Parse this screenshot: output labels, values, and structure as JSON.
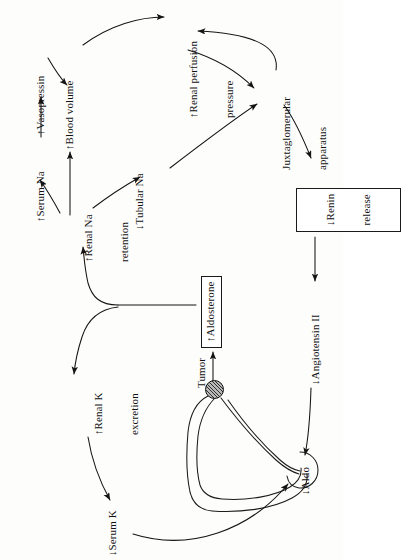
{
  "figure": {
    "orientation": "rotated-90-ccw",
    "type": "medical-flowchart"
  },
  "nodes": {
    "vasopressin": {
      "label": "↑Vasopressin",
      "boxed": false
    },
    "serum_na": {
      "label": "↑Serum Na",
      "boxed": false
    },
    "blood_volume": {
      "label": "↑Blood volume",
      "boxed": false
    },
    "renal_na_retention": {
      "line1": "↑Renal Na",
      "line2": "retention",
      "boxed": false
    },
    "tubular_na": {
      "label": "↓Tubular Na",
      "boxed": false
    },
    "renal_perfusion_pressure": {
      "line1": "↑Renal perfusion",
      "line2": "pressure",
      "boxed": false
    },
    "juxtaglomerular_apparatus": {
      "line1": "Juxtaglomerular",
      "line2": "apparatus",
      "boxed": false
    },
    "renin_release": {
      "line1": "↓Renin",
      "line2": "release",
      "boxed": true
    },
    "angiotensin_ii": {
      "label": "↓Angiotensin II",
      "boxed": false
    },
    "aldosterone": {
      "label": "↑Aldosterone",
      "boxed": true
    },
    "aldo_gland": {
      "label": "↓Aldo",
      "boxed": false
    },
    "renal_k_excretion": {
      "line1": "↑Renal K",
      "line2": "excretion",
      "boxed": false
    },
    "serum_k": {
      "label": "↓Serum K",
      "boxed": false
    },
    "tumor": {
      "label": "Tumor",
      "boxed": false
    }
  },
  "colors": {
    "ink": "#141414",
    "paper": "#fdfdfc",
    "tumor_fill": "#b9b9b9"
  }
}
